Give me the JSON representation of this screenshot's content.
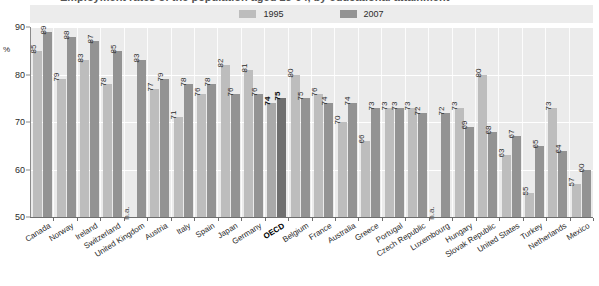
{
  "title": "Employment rates of the population aged 25-64, by educational attainment",
  "axis": {
    "unit_label": "%",
    "y_ticks": [
      "90",
      "80",
      "70",
      "60",
      "50"
    ],
    "y_min": 50,
    "y_max": 90
  },
  "legend": {
    "items": [
      {
        "label": "1995",
        "color": "#bdbdbd",
        "name": "legend-1995"
      },
      {
        "label": "2007",
        "color": "#939393",
        "name": "legend-2007"
      }
    ]
  },
  "chart_data": {
    "type": "bar",
    "title": "Employment rates of the population aged 25-64, by educational attainment",
    "xlabel": "",
    "ylabel": "%",
    "ylim": [
      50,
      90
    ],
    "grid": true,
    "legend_position": "top-center",
    "categories": [
      "Canada",
      "Norway",
      "Ireland",
      "Switzerland",
      "United Kingdom",
      "Austria",
      "Italy",
      "Spain",
      "Japan",
      "Germany",
      "OECD",
      "Belgium",
      "France",
      "Australia",
      "Greece",
      "Portugal",
      "Czech Republic",
      "Luxembourg",
      "Hungary",
      "Slovak Republic",
      "United States",
      "Turkey",
      "Netherlands",
      "Mexico"
    ],
    "highlight_category": "OECD",
    "series": [
      {
        "name": "1995",
        "color": "#bdbdbd",
        "values": [
          85,
          79,
          83,
          78,
          null,
          77,
          71,
          76,
          82,
          81,
          74,
          80,
          76,
          70,
          66,
          73,
          73,
          null,
          73,
          80,
          63,
          55,
          73,
          57
        ],
        "labels": [
          "85",
          "79",
          "83",
          "78",
          "n.a.",
          "77",
          "71",
          "76",
          "82",
          "81",
          "74",
          "80",
          "76",
          "70",
          "66",
          "73",
          "73",
          "n.a.",
          "73",
          "80",
          "63",
          "55",
          "73",
          "57"
        ]
      },
      {
        "name": "2007",
        "color": "#939393",
        "values": [
          89,
          88,
          87,
          85,
          83,
          79,
          78,
          78,
          76,
          76,
          75,
          75,
          74,
          74,
          73,
          73,
          72,
          72,
          69,
          68,
          67,
          65,
          64,
          60
        ],
        "labels": [
          "89",
          "88",
          "87",
          "85",
          "83",
          "79",
          "78",
          "78",
          "76",
          "76",
          "75",
          "75",
          "74",
          "74",
          "73",
          "73",
          "72",
          "72",
          "69",
          "68",
          "67",
          "65",
          "64",
          "60"
        ]
      }
    ]
  }
}
